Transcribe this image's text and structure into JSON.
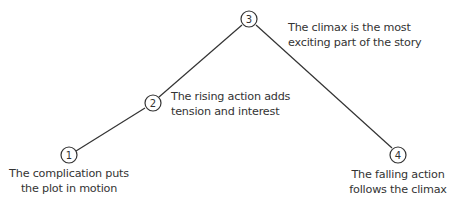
{
  "diagram": {
    "type": "plot-structure",
    "line_color": "#333333",
    "stages": [
      {
        "number": "1",
        "label_lines": [
          "The complication puts",
          "the plot in motion"
        ]
      },
      {
        "number": "2",
        "label_lines": [
          "The rising action adds",
          "tension and interest"
        ]
      },
      {
        "number": "3",
        "label_lines": [
          "The climax is the most",
          "exciting part of the story"
        ]
      },
      {
        "number": "4",
        "label_lines": [
          "The falling action",
          "follows the climax"
        ]
      }
    ]
  }
}
